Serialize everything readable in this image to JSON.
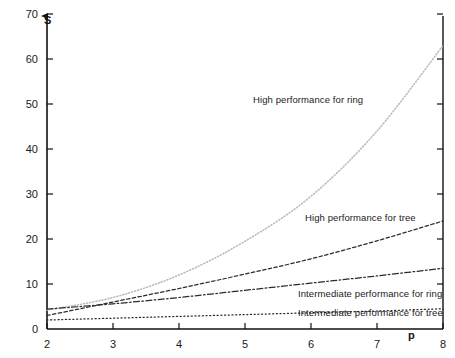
{
  "chart_data": {
    "type": "line",
    "title": "",
    "xlabel": "p",
    "ylabel": "S",
    "xlim": [
      2,
      8
    ],
    "ylim": [
      0,
      70
    ],
    "xticks": [
      2,
      3,
      4,
      5,
      6,
      7,
      8
    ],
    "yticks": [
      0,
      10,
      20,
      30,
      40,
      50,
      60,
      70
    ],
    "grid": false,
    "legend_position": "inline-annotations",
    "x": [
      2,
      3,
      4,
      5,
      6,
      7,
      8
    ],
    "series": [
      {
        "name": "High performance for ring",
        "values": [
          4.2,
          7.0,
          12.0,
          19.5,
          29.5,
          44.0,
          63.0
        ],
        "style": "fine-dotted",
        "color": "#b9b9b9"
      },
      {
        "name": "High performance for tree",
        "values": [
          3.0,
          6.0,
          9.0,
          12.2,
          15.6,
          19.6,
          24.0
        ],
        "style": "dashed",
        "color": "#2b2b2b"
      },
      {
        "name": "Intermediate performance for ring",
        "values": [
          4.4,
          5.6,
          7.0,
          8.6,
          10.2,
          11.8,
          13.5
        ],
        "style": "dash-dot",
        "color": "#2b2b2b"
      },
      {
        "name": "Intermediate performance for tree",
        "values": [
          2.0,
          2.4,
          2.8,
          3.2,
          3.6,
          4.0,
          4.5
        ],
        "style": "dotted",
        "color": "#2b2b2b"
      }
    ],
    "annotations": [
      {
        "text": "High performance for ring",
        "x_px": 253,
        "y_px": 94
      },
      {
        "text": "High performance for tree",
        "x_px": 305,
        "y_px": 212
      },
      {
        "text": "Intermediate performance for ring",
        "x_px": 298,
        "y_px": 288
      },
      {
        "text": "Intermediate performance for tree",
        "x_px": 298,
        "y_px": 307
      }
    ]
  },
  "axes": {
    "y_labels": [
      "70",
      "60",
      "50",
      "40",
      "30",
      "20",
      "10",
      "0"
    ],
    "x_labels": [
      "2",
      "3",
      "4",
      "5",
      "6",
      "7",
      "8"
    ],
    "y_axis_title": "S",
    "x_axis_title": "p"
  }
}
